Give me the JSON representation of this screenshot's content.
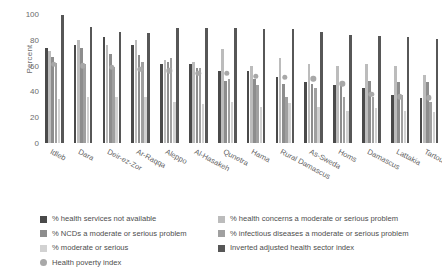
{
  "chart_data": {
    "type": "bar",
    "title": "",
    "xlabel": "",
    "ylabel": "Percent",
    "ylim": [
      0,
      100
    ],
    "yticks": [
      100,
      80,
      60,
      40,
      20,
      0
    ],
    "grid": false,
    "legend_position": "bottom",
    "categories": [
      "Idleb",
      "Dara",
      "Deir-ez-Zor",
      "Ar-Raqqa",
      "Aleppo",
      "Al-Hasakeh",
      "Qunetra",
      "Hama",
      "Rural Damascus",
      "As-Sweda",
      "Homs",
      "Damascus",
      "Lattakia",
      "Tartous"
    ],
    "series": [
      {
        "name": "% health services not available",
        "color": "#4a4a4a",
        "marker": "bar",
        "values": [
          74,
          76,
          82,
          76,
          61,
          61,
          56,
          56,
          51,
          47,
          45,
          43,
          37,
          35
        ]
      },
      {
        "name": "% health concerns a moderate or serious problem",
        "color": "#bcbcbc",
        "marker": "bar",
        "values": [
          71,
          80,
          76,
          80,
          64,
          63,
          73,
          60,
          66,
          61,
          60,
          61,
          60,
          53
        ]
      },
      {
        "name": "% NCDs a moderate or serious problem",
        "color": "#8d8d8d",
        "marker": "bar",
        "values": [
          67,
          74,
          69,
          68,
          63,
          58,
          48,
          50,
          46,
          46,
          45,
          48,
          47,
          47
        ]
      },
      {
        "name": "% infectious diseases a moderate or serious problem",
        "color": "#a0a0a0",
        "marker": "bar",
        "values": [
          62,
          61,
          59,
          63,
          66,
          58,
          50,
          45,
          36,
          43,
          36,
          36,
          37,
          32
        ]
      },
      {
        "name": "% moderate or serious",
        "color": "#d2d2d2",
        "marker": "bar",
        "values": [
          34,
          36,
          36,
          36,
          32,
          30,
          32,
          28,
          31,
          28,
          25,
          27,
          25,
          24
        ]
      },
      {
        "name": "Inverted adjusted health sector index",
        "color": "#575757",
        "marker": "bar",
        "values": [
          99,
          90,
          86,
          85,
          89,
          89,
          89,
          88,
          88,
          86,
          84,
          83,
          82,
          81
        ]
      },
      {
        "name": "Health poverty index",
        "color": "#a8a8a8",
        "marker": "dot",
        "values": [
          61,
          60,
          59,
          57,
          56,
          54,
          54,
          52,
          51,
          50,
          46,
          38,
          36,
          35
        ]
      }
    ]
  },
  "legend": {
    "left_items": [
      {
        "label": "% health services not available",
        "color": "#4a4a4a",
        "shape": "square"
      },
      {
        "label": "% NCDs a moderate or serious problem",
        "color": "#8d8d8d",
        "shape": "square"
      },
      {
        "label": "% moderate or serious",
        "color": "#d2d2d2",
        "shape": "square"
      },
      {
        "label": "Health poverty index",
        "color": "#a8a8a8",
        "shape": "circle"
      }
    ],
    "right_items": [
      {
        "label": "% health concerns a moderate or serious problem",
        "color": "#bcbcbc",
        "shape": "square"
      },
      {
        "label": "% infectious diseases a moderate or serious problem",
        "color": "#a0a0a0",
        "shape": "square"
      },
      {
        "label": "Inverted adjusted health sector index",
        "color": "#575757",
        "shape": "square"
      }
    ]
  }
}
